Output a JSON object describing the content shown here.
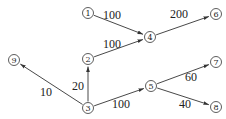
{
  "diagram": {
    "type": "directed-weighted-graph",
    "nodes": [
      {
        "id": "1",
        "label": "1"
      },
      {
        "id": "2",
        "label": "2"
      },
      {
        "id": "3",
        "label": "3"
      },
      {
        "id": "4",
        "label": "4"
      },
      {
        "id": "5",
        "label": "5"
      },
      {
        "id": "6",
        "label": "6"
      },
      {
        "id": "7",
        "label": "7"
      },
      {
        "id": "8",
        "label": "8"
      },
      {
        "id": "9",
        "label": "9"
      }
    ],
    "edges": [
      {
        "from": "1",
        "to": "4",
        "weight": "100"
      },
      {
        "from": "2",
        "to": "4",
        "weight": "100"
      },
      {
        "from": "4",
        "to": "6",
        "weight": "200"
      },
      {
        "from": "3",
        "to": "2",
        "weight": "20"
      },
      {
        "from": "3",
        "to": "9",
        "weight": "10"
      },
      {
        "from": "3",
        "to": "5",
        "weight": "100"
      },
      {
        "from": "5",
        "to": "7",
        "weight": "60"
      },
      {
        "from": "5",
        "to": "8",
        "weight": "40"
      }
    ]
  }
}
